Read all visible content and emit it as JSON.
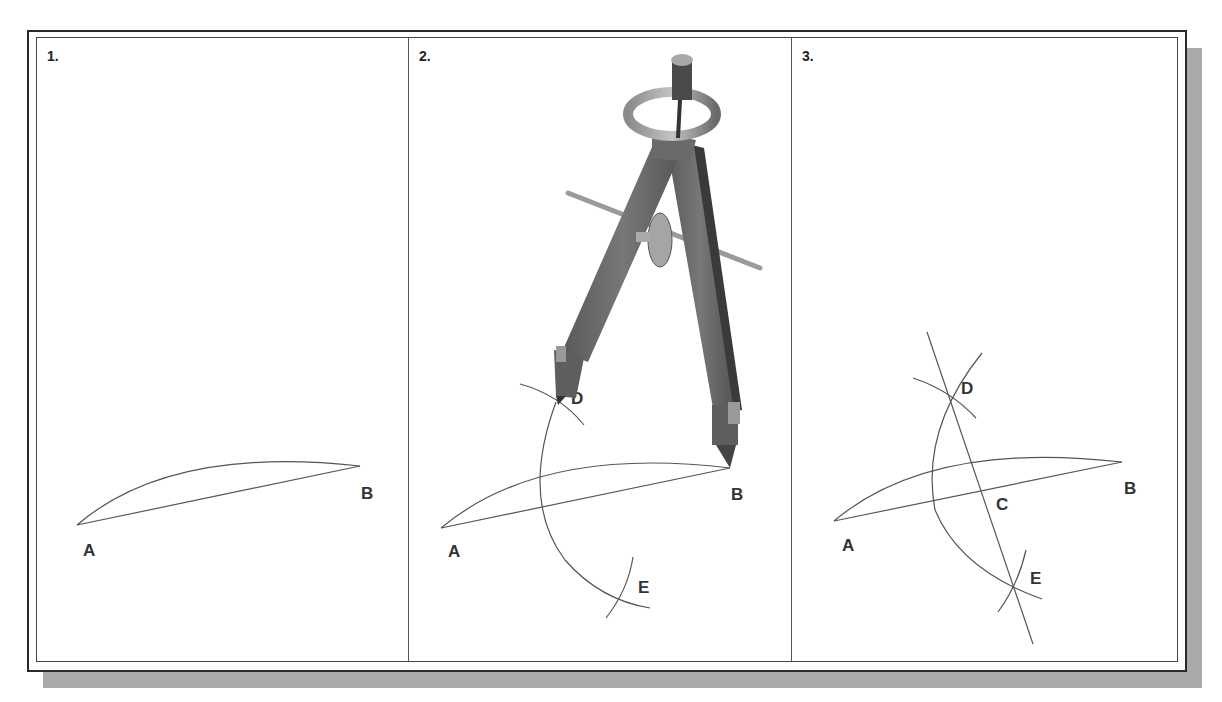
{
  "figure": {
    "panels": [
      {
        "step": "1.",
        "points": {
          "A": "A",
          "B": "B"
        }
      },
      {
        "step": "2.",
        "points": {
          "A": "A",
          "B": "B",
          "D": "D",
          "E": "E"
        },
        "tool": "compass"
      },
      {
        "step": "3.",
        "points": {
          "A": "A",
          "B": "B",
          "C": "C",
          "D": "D",
          "E": "E"
        }
      }
    ],
    "colors": {
      "line": "#555555",
      "label": "#333333",
      "frame": "#2a2a2a",
      "shadow": "#a9a9a9",
      "compass_body": "#6e6e6e",
      "compass_dark": "#3a3a3a",
      "compass_light": "#b5b5b5"
    }
  }
}
